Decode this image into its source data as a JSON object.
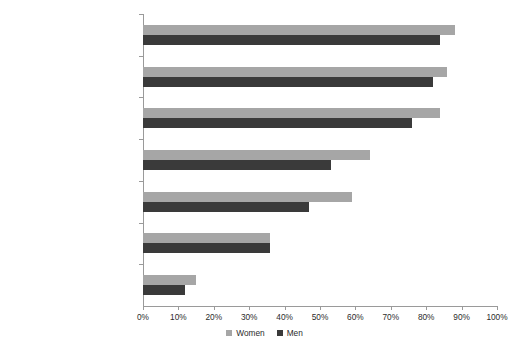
{
  "chart_data": {
    "type": "bar",
    "orientation": "horizontal",
    "title": "",
    "subtitle": "",
    "xlabel": "",
    "ylabel": "",
    "xlim": [
      0,
      100
    ],
    "xtick_labels": [
      "0%",
      "10%",
      "20%",
      "30%",
      "40%",
      "50%",
      "60%",
      "70%",
      "80%",
      "90%",
      "100%"
    ],
    "xtick_values": [
      0,
      10,
      20,
      30,
      40,
      50,
      60,
      70,
      80,
      90,
      100
    ],
    "grid": false,
    "legend_position": "bottom-center",
    "categories": [
      "Historically Black Protestant",
      "Morman",
      "Evangelical Protestant",
      "Catholic",
      "Establishment Protestant",
      "Jewish",
      "Unaffiliated"
    ],
    "series": [
      {
        "name": "Women",
        "color": "#a6a6a6",
        "values": [
          88,
          86,
          84,
          64,
          59,
          36,
          15
        ]
      },
      {
        "name": "Men",
        "color": "#3a3a3a",
        "values": [
          84,
          82,
          76,
          53,
          47,
          36,
          12
        ]
      }
    ]
  },
  "legend": {
    "items": [
      {
        "label": "Women",
        "swatch": "legend-swatch-women"
      },
      {
        "label": "Men",
        "swatch": "legend-swatch-men"
      }
    ]
  },
  "colors": {
    "women": "#a6a6a6",
    "men": "#3a3a3a",
    "axis": "#9a9a9a",
    "text": "#2b2b2b",
    "background": "#ffffff"
  }
}
